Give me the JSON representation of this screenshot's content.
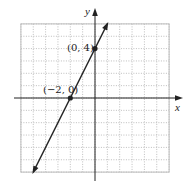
{
  "chart_data": {
    "type": "line",
    "title": "",
    "xlabel": "x",
    "ylabel": "y",
    "xlim": [
      -6,
      6
    ],
    "ylim": [
      -6,
      6
    ],
    "grid": true,
    "grid_style": "dotted, major every 1 unit",
    "series": [
      {
        "name": "y = 2x + 4",
        "x": [
          -5,
          1
        ],
        "y": [
          -6,
          6
        ],
        "arrows": "both ends"
      }
    ],
    "points": [
      {
        "x": -2,
        "y": 0,
        "label": "(−2, 0)"
      },
      {
        "x": 0,
        "y": 4,
        "label": "(0, 4)"
      }
    ],
    "colors": {
      "line": "#222222",
      "grid": "#bdbdbd",
      "axes": "#222222"
    }
  },
  "labels": {
    "x_axis": "x",
    "y_axis": "y",
    "point_a": "(−2, 0)",
    "point_b": "(0, 4)"
  }
}
